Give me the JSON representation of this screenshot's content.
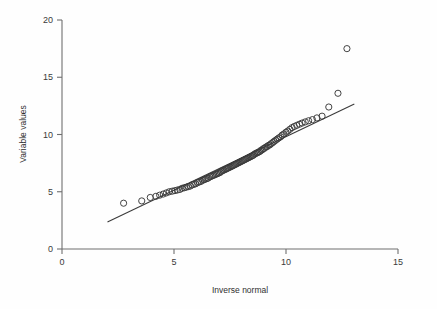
{
  "chart_data": {
    "type": "scatter",
    "title": "",
    "subtitle": "",
    "xlabel": "Inverse normal",
    "ylabel": "Variable values",
    "xlim": [
      0,
      15
    ],
    "ylim": [
      0,
      20
    ],
    "xticks": [
      0,
      5,
      10,
      15
    ],
    "yticks": [
      0,
      5,
      10,
      15,
      20
    ],
    "xtick_labels": [
      "0",
      "5",
      "10",
      "15"
    ],
    "ytick_labels": [
      "0",
      "5",
      "10",
      "15",
      "20"
    ],
    "grid": false,
    "legend": null,
    "marker": "open-circle",
    "marker_color": "#3a3a3a",
    "marker_size": 3.1,
    "line_color": "#3a3a3a",
    "background_color": "#fefefe",
    "axis_color": "#6f6f6f",
    "reference_line": {
      "name": "identity-reference-line",
      "x0": 2.03,
      "y0": 2.36,
      "x1": 13.05,
      "y1": 12.67
    },
    "series": [
      {
        "name": "Q-Q points",
        "x": [
          2.75,
          3.56,
          3.94,
          4.19,
          4.36,
          4.52,
          4.66,
          4.79,
          4.92,
          5.04,
          5.15,
          5.26,
          5.36,
          5.46,
          5.55,
          5.64,
          5.73,
          5.81,
          5.89,
          5.97,
          6.05,
          6.12,
          6.2,
          6.27,
          6.34,
          6.4,
          6.47,
          6.53,
          6.6,
          6.66,
          6.72,
          6.78,
          6.84,
          6.9,
          6.96,
          7.01,
          7.07,
          7.12,
          7.18,
          7.23,
          7.29,
          7.34,
          7.39,
          7.44,
          7.5,
          7.55,
          7.6,
          7.65,
          7.7,
          7.75,
          7.8,
          7.85,
          7.9,
          7.95,
          8.0,
          8.05,
          8.1,
          8.15,
          8.2,
          8.25,
          8.3,
          8.35,
          8.4,
          8.45,
          8.5,
          8.55,
          8.6,
          8.66,
          8.71,
          8.76,
          8.82,
          8.87,
          8.93,
          8.98,
          9.04,
          9.1,
          9.16,
          9.22,
          9.28,
          9.34,
          9.41,
          9.47,
          9.54,
          9.61,
          9.68,
          9.76,
          9.83,
          9.91,
          10.0,
          10.08,
          10.17,
          10.27,
          10.37,
          10.48,
          10.6,
          10.72,
          10.86,
          11.01,
          11.18,
          11.38,
          11.61,
          11.91,
          12.32,
          12.72
        ],
        "y": [
          4.0,
          4.2,
          4.5,
          4.6,
          4.7,
          4.8,
          4.9,
          5.0,
          5.05,
          5.1,
          5.15,
          5.2,
          5.3,
          5.35,
          5.4,
          5.45,
          5.5,
          5.6,
          5.65,
          5.7,
          5.8,
          5.85,
          5.9,
          6.0,
          6.05,
          6.1,
          6.15,
          6.2,
          6.3,
          6.35,
          6.4,
          6.45,
          6.5,
          6.55,
          6.6,
          6.65,
          6.7,
          6.8,
          6.85,
          6.9,
          6.95,
          7.0,
          7.05,
          7.1,
          7.15,
          7.2,
          7.25,
          7.3,
          7.35,
          7.4,
          7.45,
          7.5,
          7.55,
          7.6,
          7.65,
          7.7,
          7.75,
          7.8,
          7.85,
          7.9,
          7.95,
          8.0,
          8.05,
          8.1,
          8.15,
          8.2,
          8.3,
          8.35,
          8.4,
          8.45,
          8.5,
          8.6,
          8.65,
          8.75,
          8.8,
          8.9,
          8.95,
          9.05,
          9.1,
          9.2,
          9.3,
          9.4,
          9.5,
          9.6,
          9.7,
          9.8,
          9.95,
          10.05,
          10.2,
          10.3,
          10.45,
          10.6,
          10.7,
          10.8,
          10.9,
          11.0,
          11.1,
          11.2,
          11.3,
          11.45,
          11.6,
          12.4,
          13.6,
          17.5
        ]
      }
    ],
    "outliers": [
      {
        "x": 11.91,
        "y": 12.4
      },
      {
        "x": 12.32,
        "y": 13.6
      },
      {
        "x": 12.72,
        "y": 17.5
      }
    ]
  }
}
